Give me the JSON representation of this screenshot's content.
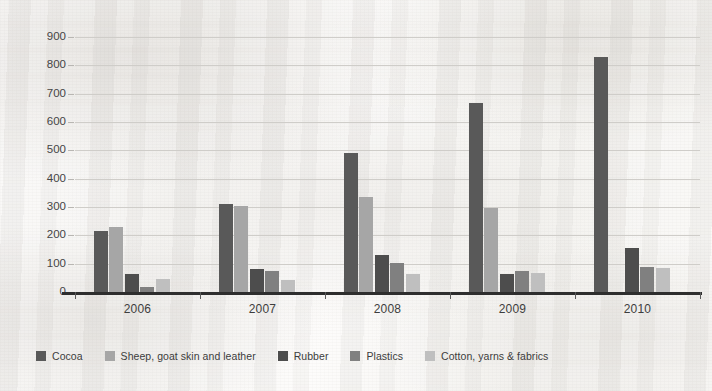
{
  "chart_data": {
    "type": "bar",
    "title": "",
    "subtitle": "",
    "xlabel": "",
    "ylabel": "",
    "categories": [
      "2006",
      "2007",
      "2008",
      "2009",
      "2010"
    ],
    "series": [
      {
        "name": "Cocoa",
        "color": "#595959",
        "values": [
          215,
          312,
          490,
          668,
          828
        ]
      },
      {
        "name": "Sheep, goat skin and leather",
        "color": "#a6a6a6",
        "values": [
          228,
          302,
          335,
          295,
          0
        ]
      },
      {
        "name": "Rubber",
        "color": "#4d4d4d",
        "values": [
          62,
          80,
          130,
          65,
          155
        ]
      },
      {
        "name": "Plastics",
        "color": "#808080",
        "values": [
          18,
          74,
          103,
          73,
          88
        ]
      },
      {
        "name": "Cotton, yarns & fabrics",
        "color": "#bfbfbf",
        "values": [
          45,
          44,
          63,
          66,
          85
        ]
      }
    ],
    "ylim": [
      0,
      900
    ],
    "ytick_step": 100,
    "ytick_labels": [
      "0",
      "100",
      "200",
      "300",
      "400",
      "500",
      "600",
      "700",
      "800",
      "900"
    ],
    "grid": true,
    "legend_position": "bottom-left"
  },
  "axes": {
    "y_axis_name": "value-axis",
    "x_axis_name": "year-axis"
  },
  "colors": {
    "gridline": "#cfcdc9",
    "axis": "#2e2e2e",
    "text": "#3d3d3d",
    "background": "#faf9f7"
  }
}
